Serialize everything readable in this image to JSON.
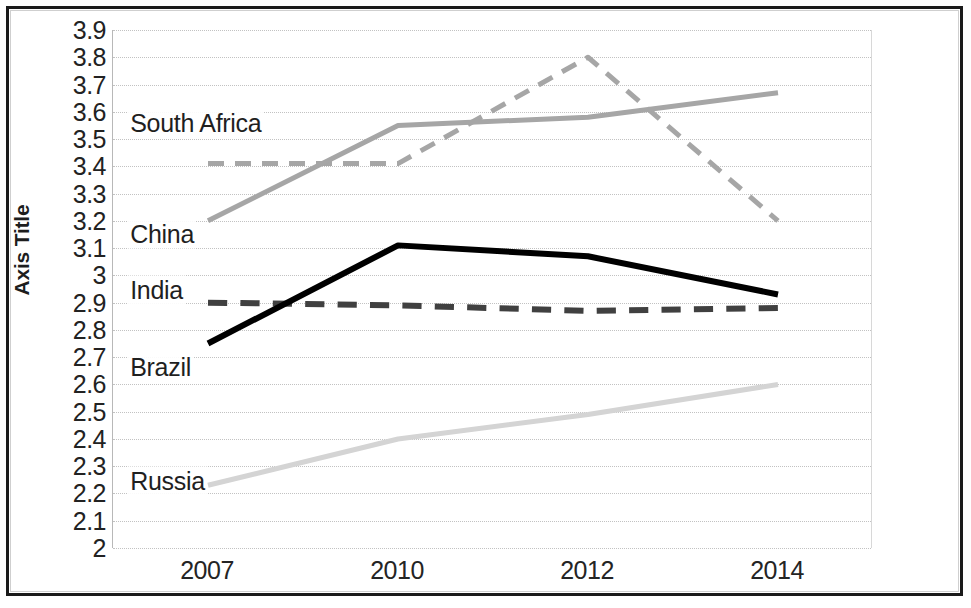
{
  "figure": {
    "y_axis_title": "Axis Title"
  },
  "chart_data": {
    "type": "line",
    "title": "",
    "xlabel": "",
    "ylabel": "Axis Title",
    "categories": [
      "2007",
      "2010",
      "2012",
      "2014"
    ],
    "x": [
      2007,
      2010,
      2012,
      2014
    ],
    "ylim": [
      2,
      3.9
    ],
    "y_ticks": [
      "3.9",
      "3.8",
      "3.7",
      "3.6",
      "3.5",
      "3.4",
      "3.3",
      "3.2",
      "3.1",
      "3",
      "2.9",
      "2.8",
      "2.7",
      "2.6",
      "2.5",
      "2.4",
      "2.3",
      "2.2",
      "2.1",
      "2"
    ],
    "y_tick_values": [
      3.9,
      3.8,
      3.7,
      3.6,
      3.5,
      3.4,
      3.3,
      3.2,
      3.1,
      3.0,
      2.9,
      2.8,
      2.7,
      2.6,
      2.5,
      2.4,
      2.3,
      2.2,
      2.1,
      2.0
    ],
    "grid": true,
    "legend": "inline-labels",
    "series": [
      {
        "name": "South Africa",
        "values": [
          3.41,
          3.41,
          3.8,
          3.2
        ],
        "color": "#a6a6a6",
        "style": "dashed",
        "width": 5
      },
      {
        "name": "China",
        "values": [
          3.2,
          3.55,
          3.58,
          3.67
        ],
        "color": "#a6a6a6",
        "style": "solid",
        "width": 5
      },
      {
        "name": "India",
        "values": [
          2.9,
          2.89,
          2.87,
          2.88
        ],
        "color": "#404040",
        "style": "dashed",
        "width": 6
      },
      {
        "name": "Brazil",
        "values": [
          2.75,
          3.11,
          3.07,
          2.93
        ],
        "color": "#000000",
        "style": "solid",
        "width": 6
      },
      {
        "name": "Russia",
        "values": [
          2.23,
          2.4,
          2.49,
          2.6
        ],
        "color": "#d4d4d4",
        "style": "solid",
        "width": 5
      }
    ],
    "inline_labels": [
      {
        "text": "South Africa",
        "value": 3.56,
        "x_frac": 0.02
      },
      {
        "text": "China",
        "value": 3.15,
        "x_frac": 0.02
      },
      {
        "text": "India",
        "value": 2.945,
        "x_frac": 0.02
      },
      {
        "text": "Brazil",
        "value": 2.665,
        "x_frac": 0.02
      },
      {
        "text": "Russia",
        "value": 2.245,
        "x_frac": 0.02
      }
    ]
  }
}
